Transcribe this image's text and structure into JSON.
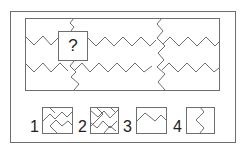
{
  "puzzle": {
    "question_mark": "?",
    "line_color": "#6e6e6e",
    "background": "#ffffff"
  },
  "options": [
    {
      "label": "1",
      "description": "square with interlocking zigzag pinwheel pattern"
    },
    {
      "label": "2",
      "description": "square with double zigzag cross pattern"
    },
    {
      "label": "3",
      "description": "square with single horizontal zigzag line"
    },
    {
      "label": "4",
      "description": "square with single vertical zigzag line"
    }
  ]
}
